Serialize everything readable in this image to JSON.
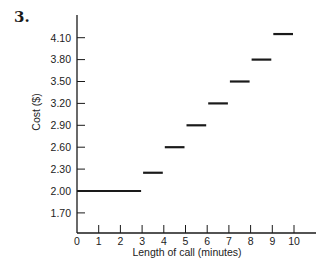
{
  "problem_number": "3.",
  "chart_data": {
    "type": "line",
    "subtype": "step",
    "title": "",
    "xlabel": "Length of call (minutes)",
    "ylabel": "Cost ($)",
    "xlim": [
      0,
      11
    ],
    "ylim": [
      1.4,
      4.4
    ],
    "x_ticks": [
      0,
      1,
      2,
      3,
      4,
      5,
      6,
      7,
      8,
      9,
      10
    ],
    "x_tick_labels": [
      "0",
      "1",
      "2",
      "3",
      "4",
      "5",
      "6",
      "7",
      "8",
      "9",
      "10"
    ],
    "y_ticks": [
      1.7,
      2.0,
      2.3,
      2.6,
      2.9,
      3.2,
      3.5,
      3.8,
      4.1
    ],
    "y_tick_labels": [
      "1.70",
      "2.00",
      "2.30",
      "2.60",
      "2.90",
      "3.20",
      "3.50",
      "3.80",
      "4.10"
    ],
    "grid": false,
    "legend": null,
    "segments": [
      {
        "x_start": 0,
        "x_end": 3,
        "y": 2.0
      },
      {
        "x_start": 3,
        "x_end": 4,
        "y": 2.25
      },
      {
        "x_start": 4,
        "x_end": 5,
        "y": 2.6
      },
      {
        "x_start": 5,
        "x_end": 6,
        "y": 2.9
      },
      {
        "x_start": 6,
        "x_end": 7,
        "y": 3.2
      },
      {
        "x_start": 7,
        "x_end": 8,
        "y": 3.5
      },
      {
        "x_start": 8,
        "x_end": 9,
        "y": 3.8
      },
      {
        "x_start": 9,
        "x_end": 10,
        "y": 4.15
      }
    ],
    "line_color": "#1a1a1a"
  }
}
